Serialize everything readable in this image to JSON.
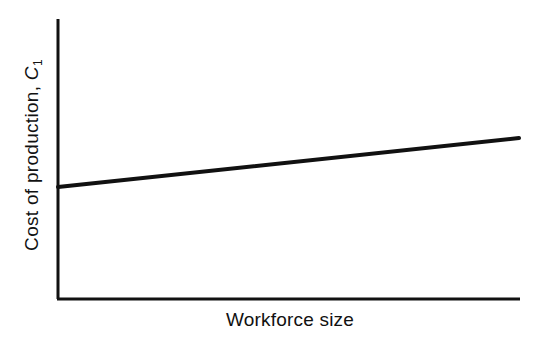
{
  "chart_data": {
    "type": "line",
    "title": "",
    "xlabel": "Workforce size",
    "ylabel": "Cost of production, C1",
    "ylabel_parts": {
      "text": "Cost of production, ",
      "var": "C",
      "sub": "1"
    },
    "x": [
      0,
      1
    ],
    "series": [
      {
        "name": "C1",
        "values": [
          0.4,
          0.575
        ]
      }
    ],
    "xlim": [
      0,
      1
    ],
    "ylim": [
      0,
      1
    ],
    "grid": false,
    "legend": null,
    "ticks": "none",
    "line_color": "#111111"
  },
  "plot_area": {
    "left": 58,
    "top": 19,
    "right": 520,
    "bottom": 299
  }
}
